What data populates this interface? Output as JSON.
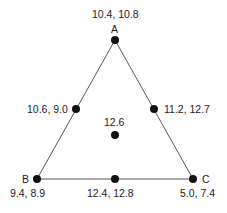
{
  "diagram": {
    "type": "triangle-mixture-design",
    "vertices": {
      "A": {
        "label": "A",
        "values": "10.4, 10.8"
      },
      "B": {
        "label": "B",
        "values": "9.4, 8.9"
      },
      "C": {
        "label": "C",
        "values": "5.0, 7.4"
      }
    },
    "midpoints": {
      "AB": {
        "values": "10.6, 9.0"
      },
      "AC": {
        "values": "11.2, 12.7"
      },
      "BC": {
        "values": "12.4, 12.8"
      }
    },
    "centroid": {
      "values": "12.6"
    },
    "colors": {
      "line": "#555555",
      "point": "#111111",
      "text": "#222222"
    }
  }
}
